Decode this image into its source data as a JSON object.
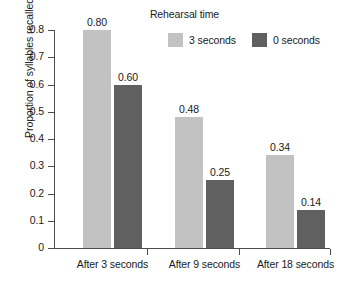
{
  "chart_data": {
    "type": "bar",
    "title": "",
    "legend_title": "Rehearsal time",
    "legend_position": "top-right",
    "grid": false,
    "categories": [
      "After 3 seconds",
      "After 9 seconds",
      "After 18 seconds"
    ],
    "series": [
      {
        "name": "3 seconds",
        "color": "#c2c2c2",
        "values": [
          0.8,
          0.48,
          0.34
        ],
        "labels": [
          "0.80",
          "0.48",
          "0.34"
        ]
      },
      {
        "name": "0 seconds",
        "color": "#606060",
        "values": [
          0.6,
          0.25,
          0.14
        ],
        "labels": [
          "0.60",
          "0.25",
          "0.14"
        ]
      }
    ],
    "xlabel": "",
    "ylabel": "Proportion of syllables recalled",
    "ylim": [
      0,
      0.8
    ],
    "ytick_labels": [
      "0.8",
      "0.7",
      "0.6",
      "0.5",
      "0.4",
      "0.3",
      "0.2",
      "0.1",
      "0"
    ],
    "ytick_values": [
      0.8,
      0.7,
      0.6,
      0.5,
      0.4,
      0.3,
      0.2,
      0.1,
      0
    ]
  },
  "axis": {
    "y_title": "Proportion of syllables recalled"
  },
  "legend": {
    "title": "Rehearsal time",
    "entries": [
      {
        "label": "3 seconds",
        "color": "#c2c2c2"
      },
      {
        "label": "0 seconds",
        "color": "#606060"
      }
    ]
  },
  "ticks": {
    "y": [
      {
        "label": "0.8"
      },
      {
        "label": "0.7"
      },
      {
        "label": "0.6"
      },
      {
        "label": "0.5"
      },
      {
        "label": "0.4"
      },
      {
        "label": "0.3"
      },
      {
        "label": "0.2"
      },
      {
        "label": "0.1"
      },
      {
        "label": "0"
      }
    ]
  },
  "categories": [
    {
      "label": "After 3 seconds"
    },
    {
      "label": "After 9 seconds"
    },
    {
      "label": "After 18 seconds"
    }
  ],
  "bars": [
    {
      "label": "0.80",
      "value": 0.8,
      "series": "3 seconds",
      "group": "After 3 seconds"
    },
    {
      "label": "0.60",
      "value": 0.6,
      "series": "0 seconds",
      "group": "After 3 seconds"
    },
    {
      "label": "0.48",
      "value": 0.48,
      "series": "3 seconds",
      "group": "After 9 seconds"
    },
    {
      "label": "0.25",
      "value": 0.25,
      "series": "0 seconds",
      "group": "After 9 seconds"
    },
    {
      "label": "0.34",
      "value": 0.34,
      "series": "3 seconds",
      "group": "After 18 seconds"
    },
    {
      "label": "0.14",
      "value": 0.14,
      "series": "0 seconds",
      "group": "After 18 seconds"
    }
  ],
  "colors": {
    "light_bar": "#c2c2c2",
    "dark_bar": "#606060",
    "axis": "#4d4d4d",
    "text": "#1a1a1a",
    "background": "#ffffff"
  }
}
